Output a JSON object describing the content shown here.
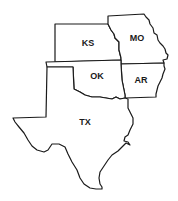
{
  "map": {
    "stroke_color": "#1a1a1a",
    "fill_color": "#ffffff",
    "states": [
      {
        "id": "ks",
        "label": "KS",
        "label_pos": [
          88,
          43
        ],
        "path": "M55,24 L108,24 L111,30 L114,34 L115,38 L119,42 L119,50 L121,58 L121,60 L55,62 Z"
      },
      {
        "id": "mo",
        "label": "MO",
        "label_pos": [
          137,
          38
        ],
        "path": "M108,16 L144,14 L146,17 L149,20 L150,24 L153,28 L154,33 L157,35 L158,40 L160,43 L163,46 L165,49 L166,53 L168,55 L167,59 L163,60 L164,63 L121,64 L121,58 L119,50 L119,42 L115,38 L114,34 L111,30 L108,24 L108,16 Z"
      },
      {
        "id": "ar",
        "label": "AR",
        "label_pos": [
          141,
          80
        ],
        "path": "M121,64 L164,63 L164,66 L165,69 L163,74 L162,78 L160,82 L158,86 L157,90 L156,94 L156,97 L125,98 L125,95 L122,80 Z"
      },
      {
        "id": "ok",
        "label": "OK",
        "label_pos": [
          97,
          76
        ],
        "path": "M46,62 L121,60 L121,64 L122,80 L125,95 L125,98 L120,99 L116,97 L112,99 L106,98 L100,97 L92,97 L85,95 L80,92 L76,90 L74,89 L73,67 L47,67 Z"
      },
      {
        "id": "tx",
        "label": "TX",
        "label_pos": [
          85,
          122
        ],
        "path": "M47,67 L73,67 L74,89 L76,90 L80,92 L85,95 L92,97 L100,97 L106,98 L112,99 L116,97 L120,99 L125,98 L128,99 L128,108 L130,112 L133,118 L133,124 L130,130 L128,135 L125,137 L124,141 L128,142 L130,145 L126,143 L122,147 L118,151 L112,155 L108,160 L104,166 L100,172 L99,178 L100,184 L102,187 L102,189 L96,189 L90,188 L84,184 L80,178 L77,170 L72,162 L68,154 L65,147 L59,144 L52,144 L48,150 L44,152 L37,150 L32,146 L28,140 L24,133 L19,127 L15,122 L13,118 L46,117 Z"
      }
    ]
  }
}
